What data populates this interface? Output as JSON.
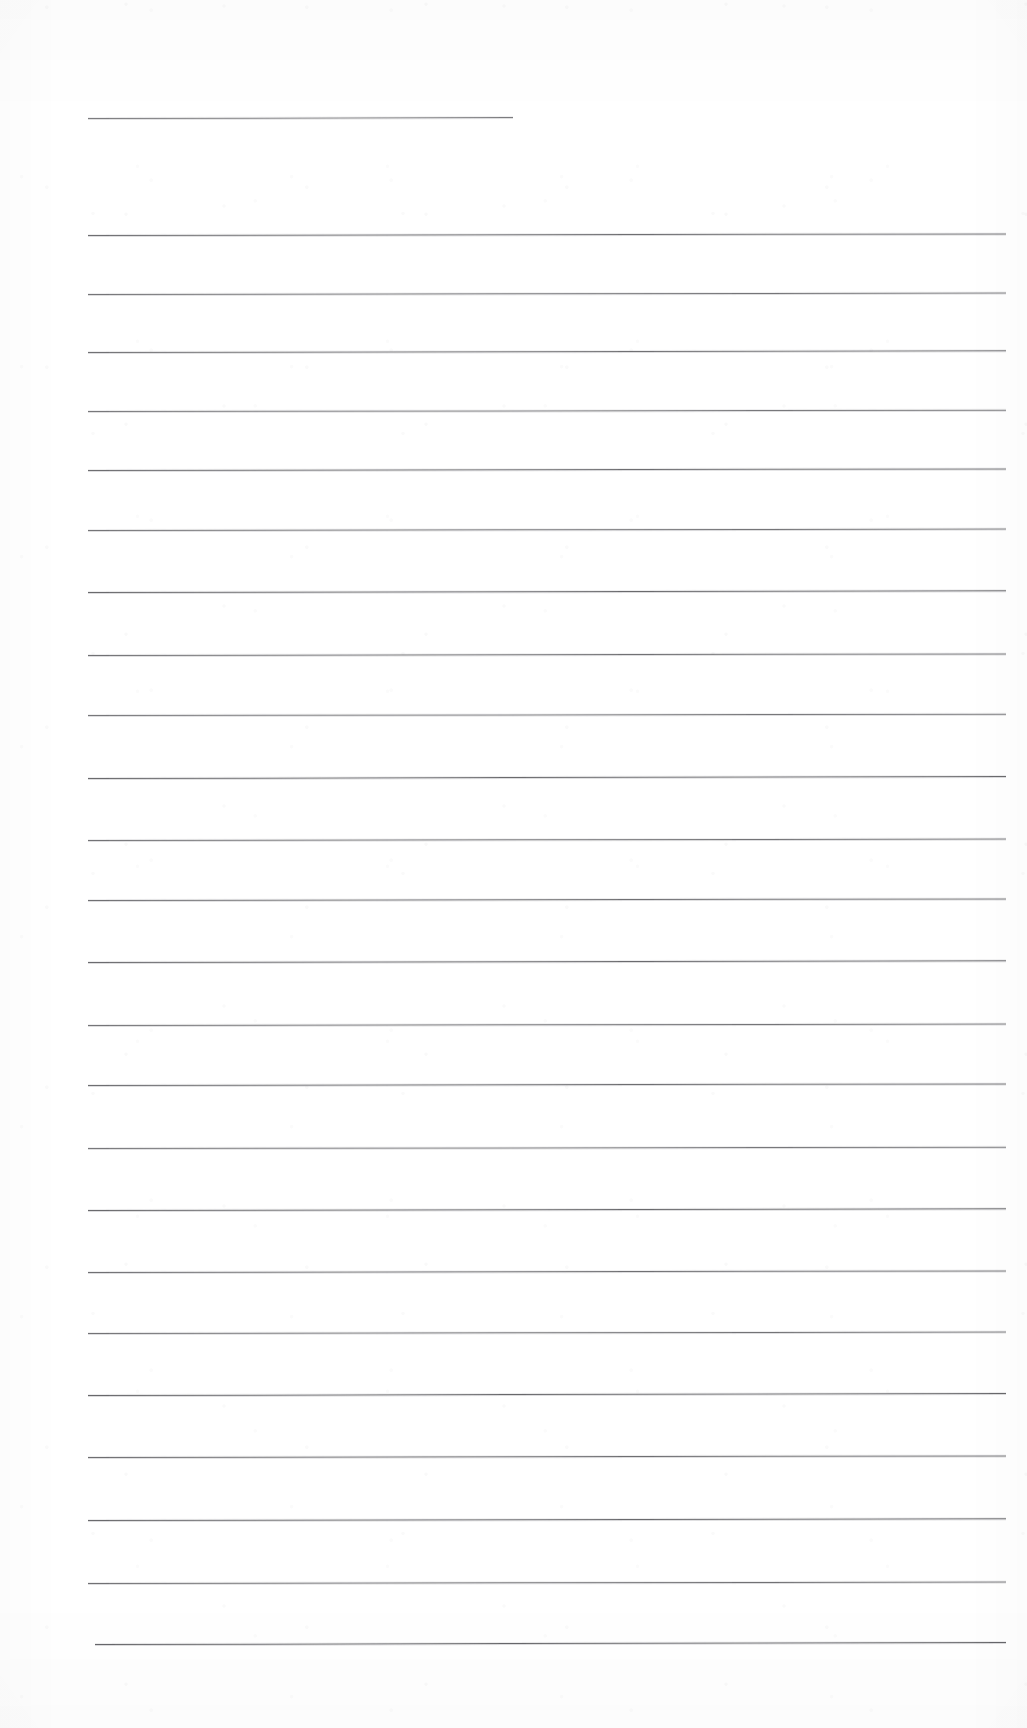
{
  "document": {
    "kind": "scanned-ruled-paper",
    "title": "Blank lined notebook page (scan)",
    "page_width": 1027,
    "page_height": 1728,
    "background_color": "#ffffff",
    "rule_color": "#4a4a4e",
    "has_text": false,
    "has_margin_rule": false,
    "visible_text": ""
  },
  "rules": {
    "count": 24,
    "left_x": 88,
    "right_x": 1006,
    "thickness_px": 1,
    "lines": [
      {
        "index": 1,
        "y": 118,
        "x1": 88,
        "x2": 513,
        "tilt_deg": -0.12,
        "weight": 0.72
      },
      {
        "index": 2,
        "y": 235,
        "x1": 88,
        "x2": 1006,
        "tilt_deg": -0.1,
        "weight": 0.8
      },
      {
        "index": 3,
        "y": 294,
        "x1": 88,
        "x2": 1006,
        "tilt_deg": -0.09,
        "weight": 0.76
      },
      {
        "index": 4,
        "y": 352,
        "x1": 88,
        "x2": 1006,
        "tilt_deg": -0.11,
        "weight": 0.78
      },
      {
        "index": 5,
        "y": 411,
        "x1": 88,
        "x2": 1006,
        "tilt_deg": -0.08,
        "weight": 0.74
      },
      {
        "index": 6,
        "y": 470,
        "x1": 88,
        "x2": 1006,
        "tilt_deg": -0.1,
        "weight": 0.8
      },
      {
        "index": 7,
        "y": 530,
        "x1": 88,
        "x2": 1006,
        "tilt_deg": -0.09,
        "weight": 0.76
      },
      {
        "index": 8,
        "y": 592,
        "x1": 88,
        "x2": 1006,
        "tilt_deg": -0.11,
        "weight": 0.82
      },
      {
        "index": 9,
        "y": 655,
        "x1": 88,
        "x2": 1006,
        "tilt_deg": -0.1,
        "weight": 0.78
      },
      {
        "index": 10,
        "y": 715,
        "x1": 88,
        "x2": 1006,
        "tilt_deg": -0.08,
        "weight": 0.75
      },
      {
        "index": 11,
        "y": 778,
        "x1": 88,
        "x2": 1006,
        "tilt_deg": -0.12,
        "weight": 0.82
      },
      {
        "index": 12,
        "y": 840,
        "x1": 88,
        "x2": 1006,
        "tilt_deg": -0.09,
        "weight": 0.77
      },
      {
        "index": 13,
        "y": 900,
        "x1": 88,
        "x2": 1006,
        "tilt_deg": -0.1,
        "weight": 0.79
      },
      {
        "index": 14,
        "y": 962,
        "x1": 88,
        "x2": 1006,
        "tilt_deg": -0.11,
        "weight": 0.81
      },
      {
        "index": 15,
        "y": 1025,
        "x1": 88,
        "x2": 1006,
        "tilt_deg": -0.09,
        "weight": 0.76
      },
      {
        "index": 16,
        "y": 1085,
        "x1": 88,
        "x2": 1006,
        "tilt_deg": -0.1,
        "weight": 0.8
      },
      {
        "index": 17,
        "y": 1148,
        "x1": 88,
        "x2": 1006,
        "tilt_deg": -0.08,
        "weight": 0.74
      },
      {
        "index": 18,
        "y": 1210,
        "x1": 88,
        "x2": 1006,
        "tilt_deg": -0.11,
        "weight": 0.82
      },
      {
        "index": 19,
        "y": 1272,
        "x1": 88,
        "x2": 1006,
        "tilt_deg": -0.1,
        "weight": 0.79
      },
      {
        "index": 20,
        "y": 1333,
        "x1": 88,
        "x2": 1006,
        "tilt_deg": -0.09,
        "weight": 0.77
      },
      {
        "index": 21,
        "y": 1395,
        "x1": 88,
        "x2": 1006,
        "tilt_deg": -0.12,
        "weight": 0.83
      },
      {
        "index": 22,
        "y": 1457,
        "x1": 88,
        "x2": 1006,
        "tilt_deg": -0.1,
        "weight": 0.8
      },
      {
        "index": 23,
        "y": 1520,
        "x1": 88,
        "x2": 1006,
        "tilt_deg": -0.11,
        "weight": 0.82
      },
      {
        "index": 24,
        "y": 1583,
        "x1": 88,
        "x2": 1006,
        "tilt_deg": -0.09,
        "weight": 0.78
      },
      {
        "index": 25,
        "y": 1644,
        "x1": 95,
        "x2": 1006,
        "tilt_deg": -0.13,
        "weight": 0.84
      }
    ]
  }
}
